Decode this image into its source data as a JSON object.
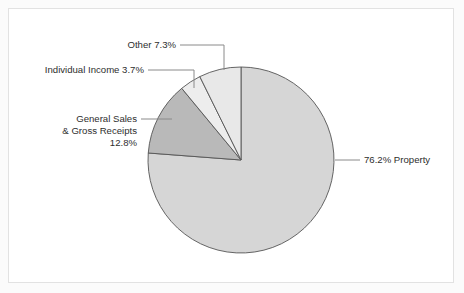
{
  "chart_data": {
    "type": "pie",
    "title": "",
    "subtitle": "",
    "xlabel": "",
    "ylabel": "",
    "legend_position": "none",
    "grid": false,
    "start_angle_deg": 90,
    "direction": "counterclockwise",
    "categories": [
      "Other",
      "Individual Income",
      "General Sales & Gross Receipts",
      "Property"
    ],
    "values": [
      7.3,
      3.7,
      12.8,
      76.2
    ],
    "value_unit": "%",
    "slices": [
      {
        "name": "Other",
        "value": 7.3,
        "label": "Other 7.3%",
        "color": "#e8e8e8",
        "label_lines": [
          "Other 7.3%"
        ]
      },
      {
        "name": "Individual Income",
        "value": 3.7,
        "label": "Individual Income 3.7%",
        "color": "#ededed",
        "label_lines": [
          "Individual Income 3.7%"
        ]
      },
      {
        "name": "General Sales & Gross Receipts",
        "value": 12.8,
        "label": "General Sales & Gross Receipts 12.8%",
        "color": "#b9b9b9",
        "label_lines": [
          "General Sales",
          "& Gross Receipts",
          "12.8%"
        ]
      },
      {
        "name": "Property",
        "value": 76.2,
        "label": "76.2% Property",
        "color": "#d6d6d6",
        "label_lines": [
          "76.2% Property"
        ]
      }
    ]
  },
  "labels": {
    "other": "Other 7.3%",
    "individual_income": "Individual Income 3.7%",
    "general_sales_line1": "General Sales",
    "general_sales_line2": "& Gross Receipts",
    "general_sales_line3": "12.8%",
    "property": "76.2% Property"
  },
  "colors": {
    "other": "#e8e8e8",
    "individual_income": "#ededed",
    "general_sales": "#b9b9b9",
    "property": "#d6d6d6",
    "slice_stroke": "#555555",
    "leader_line": "#8a8a8a",
    "frame_border": "#e2e2e2",
    "panel_background": "#ffffff",
    "text": "#2e2e2e"
  }
}
